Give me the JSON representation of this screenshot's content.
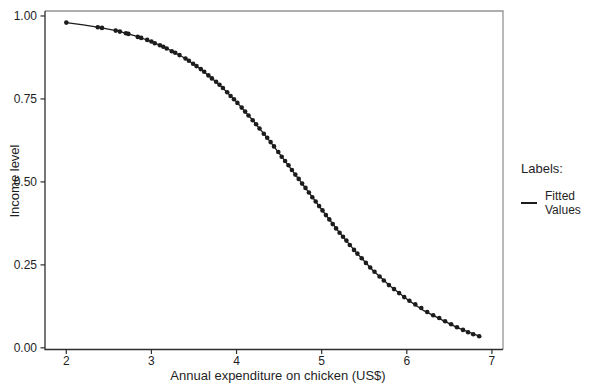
{
  "colors": {
    "ink": "#1c1c1c",
    "frame_dark": "#2e2e2e",
    "frame_light": "#949494",
    "text": "#1f1f1f",
    "background": "#ffffff"
  },
  "chart_data": {
    "type": "scatter",
    "title": "",
    "xlabel": "Annual expenditure on chicken (US$)",
    "ylabel": "Income level",
    "xlim": [
      1.75,
      7.13
    ],
    "ylim": [
      -0.005,
      1.015
    ],
    "grid": false,
    "x_ticks": {
      "values": [
        2,
        3,
        4,
        5,
        6,
        7
      ],
      "labels": [
        "2",
        "3",
        "4",
        "5",
        "6",
        "7"
      ]
    },
    "y_ticks": {
      "values": [
        0.0,
        0.25,
        0.5,
        0.75,
        1.0
      ],
      "labels": [
        "0.00",
        "0.25",
        "0.50",
        "0.75",
        "1.00"
      ]
    },
    "legend": {
      "title": "Labels:",
      "position": "right",
      "entries": [
        {
          "label": "Fitted Values",
          "marker": "line",
          "color": "#1c1c1c"
        }
      ]
    },
    "series": [
      {
        "name": "Fitted Values",
        "color": "#1c1c1c",
        "curve": [
          [
            2.0,
            0.98
          ],
          [
            2.2,
            0.973
          ],
          [
            2.4,
            0.965
          ],
          [
            2.6,
            0.955
          ],
          [
            2.8,
            0.941
          ],
          [
            3.0,
            0.923
          ],
          [
            3.2,
            0.9
          ],
          [
            3.4,
            0.872
          ],
          [
            3.6,
            0.836
          ],
          [
            3.8,
            0.793
          ],
          [
            4.0,
            0.741
          ],
          [
            4.2,
            0.683
          ],
          [
            4.4,
            0.62
          ],
          [
            4.6,
            0.553
          ],
          [
            4.8,
            0.485
          ],
          [
            5.0,
            0.417
          ],
          [
            5.2,
            0.35
          ],
          [
            5.4,
            0.289
          ],
          [
            5.6,
            0.234
          ],
          [
            5.8,
            0.187
          ],
          [
            6.0,
            0.147
          ],
          [
            6.2,
            0.112
          ],
          [
            6.4,
            0.086
          ],
          [
            6.6,
            0.06
          ],
          [
            6.85,
            0.035
          ]
        ],
        "points": [
          [
            2.0,
            0.98
          ],
          [
            2.37,
            0.966
          ],
          [
            2.42,
            0.964
          ],
          [
            2.58,
            0.956
          ],
          [
            2.63,
            0.953
          ],
          [
            2.7,
            0.948
          ],
          [
            2.73,
            0.946
          ],
          [
            2.84,
            0.937
          ],
          [
            2.88,
            0.934
          ],
          [
            2.95,
            0.928
          ],
          [
            3.0,
            0.923
          ],
          [
            3.04,
            0.918
          ],
          [
            3.1,
            0.912
          ],
          [
            3.14,
            0.907
          ],
          [
            3.18,
            0.902
          ],
          [
            3.24,
            0.894
          ],
          [
            3.28,
            0.889
          ],
          [
            3.33,
            0.882
          ],
          [
            3.4,
            0.872
          ],
          [
            3.44,
            0.865
          ],
          [
            3.49,
            0.856
          ],
          [
            3.53,
            0.849
          ],
          [
            3.58,
            0.84
          ],
          [
            3.62,
            0.832
          ],
          [
            3.67,
            0.821
          ],
          [
            3.71,
            0.812
          ],
          [
            3.76,
            0.802
          ],
          [
            3.8,
            0.793
          ],
          [
            3.84,
            0.783
          ],
          [
            3.89,
            0.77
          ],
          [
            3.93,
            0.759
          ],
          [
            3.97,
            0.749
          ],
          [
            4.01,
            0.738
          ],
          [
            4.06,
            0.724
          ],
          [
            4.1,
            0.712
          ],
          [
            4.14,
            0.7
          ],
          [
            4.19,
            0.686
          ],
          [
            4.23,
            0.674
          ],
          [
            4.27,
            0.661
          ],
          [
            4.32,
            0.645
          ],
          [
            4.36,
            0.633
          ],
          [
            4.4,
            0.62
          ],
          [
            4.44,
            0.607
          ],
          [
            4.49,
            0.59
          ],
          [
            4.53,
            0.576
          ],
          [
            4.57,
            0.563
          ],
          [
            4.61,
            0.55
          ],
          [
            4.65,
            0.536
          ],
          [
            4.69,
            0.522
          ],
          [
            4.73,
            0.509
          ],
          [
            4.77,
            0.495
          ],
          [
            4.81,
            0.482
          ],
          [
            4.85,
            0.468
          ],
          [
            4.89,
            0.454
          ],
          [
            4.93,
            0.441
          ],
          [
            4.97,
            0.427
          ],
          [
            5.01,
            0.414
          ],
          [
            5.05,
            0.4
          ],
          [
            5.09,
            0.387
          ],
          [
            5.13,
            0.373
          ],
          [
            5.17,
            0.36
          ],
          [
            5.21,
            0.347
          ],
          [
            5.25,
            0.335
          ],
          [
            5.29,
            0.323
          ],
          [
            5.33,
            0.31
          ],
          [
            5.38,
            0.295
          ],
          [
            5.42,
            0.284
          ],
          [
            5.47,
            0.27
          ],
          [
            5.52,
            0.256
          ],
          [
            5.57,
            0.242
          ],
          [
            5.62,
            0.229
          ],
          [
            5.68,
            0.215
          ],
          [
            5.73,
            0.203
          ],
          [
            5.79,
            0.189
          ],
          [
            5.85,
            0.177
          ],
          [
            5.91,
            0.165
          ],
          [
            5.97,
            0.153
          ],
          [
            6.03,
            0.142
          ],
          [
            6.1,
            0.131
          ],
          [
            6.17,
            0.12
          ],
          [
            6.24,
            0.108
          ],
          [
            6.31,
            0.098
          ],
          [
            6.38,
            0.09
          ],
          [
            6.45,
            0.08
          ],
          [
            6.52,
            0.071
          ],
          [
            6.59,
            0.062
          ],
          [
            6.66,
            0.054
          ],
          [
            6.72,
            0.047
          ],
          [
            6.78,
            0.041
          ],
          [
            6.85,
            0.035
          ]
        ]
      }
    ]
  }
}
